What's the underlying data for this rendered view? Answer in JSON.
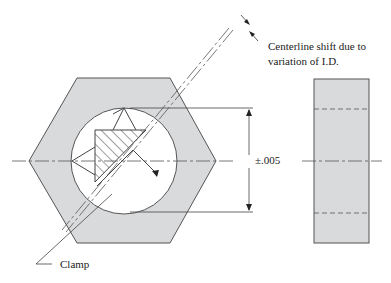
{
  "labels": {
    "centerline_note_line1": "Centerline shift due to",
    "centerline_note_line2": "variation of I.D.",
    "tolerance": "±.005",
    "clamp": "Clamp"
  },
  "colors": {
    "fill": "#d9dadc",
    "line": "#555555",
    "background": "#ffffff"
  },
  "views": {
    "front": "hexagonal part with circular bore, V-block locator and hatched clamp",
    "side": "rectangular side view with hidden bore lines and centerline"
  }
}
